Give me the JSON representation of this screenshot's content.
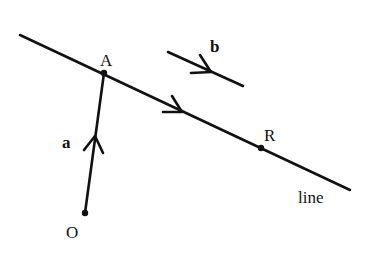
{
  "diagram": {
    "labels": {
      "point_A": "A",
      "point_R": "R",
      "point_O": "O",
      "vector_a": "a",
      "vector_b": "b",
      "line": "line"
    },
    "colors": {
      "ink": "#111111",
      "background": "#ffffff"
    },
    "elements": [
      {
        "type": "line",
        "name": "line",
        "from": [
          20,
          35
        ],
        "to": [
          350,
          190
        ],
        "arrow_at": [
          180,
          111
        ]
      },
      {
        "type": "vector",
        "name": "a",
        "from": [
          85,
          213
        ],
        "to": [
          104,
          73
        ],
        "arrow_at": [
          95,
          140
        ]
      },
      {
        "type": "vector",
        "name": "b",
        "from": [
          168,
          52
        ],
        "to": [
          243,
          86
        ],
        "arrow_at": [
          210,
          72
        ]
      },
      {
        "type": "point",
        "name": "A",
        "at": [
          104,
          73
        ]
      },
      {
        "type": "point",
        "name": "R",
        "at": [
          261,
          148
        ]
      },
      {
        "type": "point",
        "name": "O",
        "at": [
          85,
          213
        ]
      }
    ]
  }
}
